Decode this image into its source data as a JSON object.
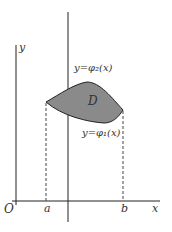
{
  "diagram": {
    "type": "region-between-curves",
    "labels": {
      "y_axis": "y",
      "x_axis": "x",
      "origin": "O",
      "a": "a",
      "b": "b",
      "region": "D",
      "upper_curve": "y=φ₂(x)",
      "lower_curve": "y=φ₁(x)"
    },
    "colors": {
      "region_fill": "#8a8a8a",
      "stroke": "#222222"
    }
  }
}
